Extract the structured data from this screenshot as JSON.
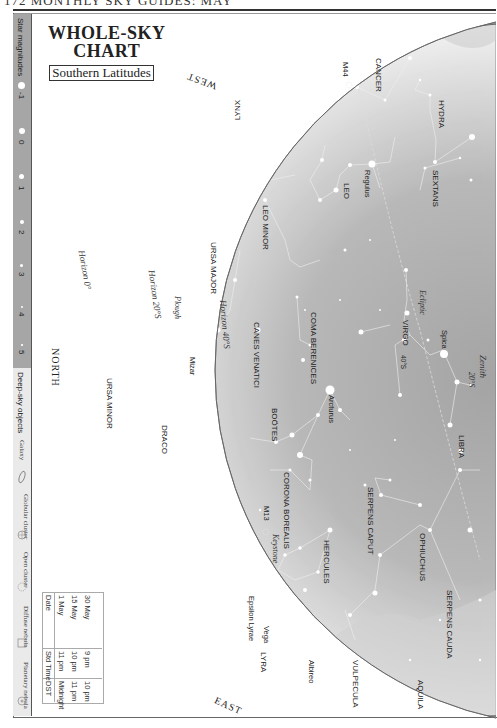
{
  "page": {
    "header_text": "172   MONTHLY SKY GUIDES: MAY"
  },
  "title": {
    "line1": "WHOLE-SKY",
    "line2": "CHART",
    "subtitle": "Southern Latitudes"
  },
  "legend": {
    "magnitudes_title": "Star magnitudes",
    "magnitudes": [
      {
        "label": "-1",
        "size": 7
      },
      {
        "label": "0",
        "size": 6
      },
      {
        "label": "1",
        "size": 5
      },
      {
        "label": "2",
        "size": 4
      },
      {
        "label": "3",
        "size": 3
      },
      {
        "label": "4",
        "size": 2
      },
      {
        "label": "5",
        "size": 1.5
      }
    ],
    "deep_sky_title": "Deep-sky objects",
    "deep_sky": [
      {
        "label": "Galaxy",
        "icon": "galaxy-ellipse-icon"
      },
      {
        "label": "Globular cluster",
        "icon": "globular-cluster-icon"
      },
      {
        "label": "Open cluster",
        "icon": "open-cluster-icon"
      },
      {
        "label": "Diffuse nebula",
        "icon": "diffuse-nebula-square-icon"
      },
      {
        "label": "Planetary nebula",
        "icon": "planetary-nebula-icon"
      }
    ]
  },
  "directions": {
    "west": "WEST",
    "north": "NORTH",
    "east": "EAST",
    "zenith": "Zenith",
    "zenith_lat": "20°S"
  },
  "horizons": {
    "h0": "Horizon 0°",
    "h20": "Horizon 20°S",
    "h40": "Horizon 40°S",
    "ecliptic": "Ecliptic",
    "marker_40": "40°S"
  },
  "constellations": {
    "cancer": "CANCER",
    "hydra": "HYDRA",
    "lynx": "LYNX",
    "leo": "LEO",
    "sextans": "SEXTANS",
    "leo_minor": "LEO MINOR",
    "ursa_major": "URSA MAJOR",
    "coma_berenices": "COMA BERENICES",
    "virgo": "VIRGO",
    "canes_venatici": "CANES VENATICI",
    "ursa_minor": "URSA MINOR",
    "bootes": "BOÖTES",
    "libra": "LIBRA",
    "draco": "DRACO",
    "corona_borealis": "CORONA BOREALIS",
    "serpens_caput": "SERPENS CAPUT",
    "ophiuchus": "OPHIUCHUS",
    "hercules": "HERCULES",
    "serpens_cauda": "SERPENS CAUDA",
    "lyra": "LYRA",
    "vulpecula": "VULPECULA",
    "aquila": "AQUILA"
  },
  "stars": {
    "m44": "M44",
    "regulus": "Regulus",
    "spica": "Spica",
    "plough": "Plough",
    "mizar": "Mizar",
    "arcturus": "Arcturus",
    "m13": "M13",
    "keystone": "Keystone",
    "epsilon_lyrae": "Epsilon Lyrae",
    "vega": "Vega",
    "albireo": "Albireo"
  },
  "viewing_table": {
    "headers": [
      "Date",
      "Std Time",
      "DST"
    ],
    "rows": [
      [
        "1 May",
        "11 pm",
        "Midnight"
      ],
      [
        "15 May",
        "10 pm",
        "11 pm"
      ],
      [
        "30 May",
        "9 pm",
        "10 pm"
      ]
    ]
  },
  "colors": {
    "sky_inner": "#a9a9a9",
    "sky_outer": "#f2f2f2",
    "legend_mag_bg": "#a6a6a6",
    "legend_deep_bg": "#eaeaea",
    "horizon_line": "#555555"
  }
}
